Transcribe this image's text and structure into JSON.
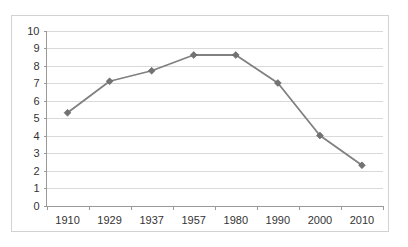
{
  "figure": {
    "faint_top_caption": "",
    "watermarks": [
      "",
      "",
      ""
    ]
  },
  "chart_data": {
    "type": "line",
    "title": "",
    "subtitle": "",
    "xlabel": "",
    "ylabel": "",
    "categories": [
      "1910",
      "1929",
      "1937",
      "1957",
      "1980",
      "1990",
      "2000",
      "2010"
    ],
    "values": [
      5.3,
      7.1,
      7.7,
      8.6,
      8.6,
      7.0,
      4.0,
      2.3
    ],
    "series": [
      {
        "name": "",
        "values": [
          5.3,
          7.1,
          7.7,
          8.6,
          8.6,
          7.0,
          4.0,
          2.3
        ]
      }
    ],
    "ylim": [
      0,
      10
    ],
    "ytick_values": [
      0,
      1,
      2,
      3,
      4,
      5,
      6,
      7,
      8,
      9,
      10
    ],
    "ytick_labels": [
      "0",
      "1",
      "2",
      "3",
      "4",
      "5",
      "6",
      "7",
      "8",
      "9",
      "10"
    ],
    "xtick_labels": [
      "1910",
      "1929",
      "1937",
      "1957",
      "1980",
      "1990",
      "2000",
      "2010"
    ],
    "grid": true,
    "grid_axis": "y",
    "legend": false,
    "legend_position": "none",
    "marker": "diamond",
    "line_color": "#808080",
    "marker_color": "#737373",
    "grid_color": "#d9d9d9",
    "axis_color": "#9a9a9a",
    "background_color": "#ffffff",
    "border_color": "#d2d2d2",
    "annotations": []
  }
}
